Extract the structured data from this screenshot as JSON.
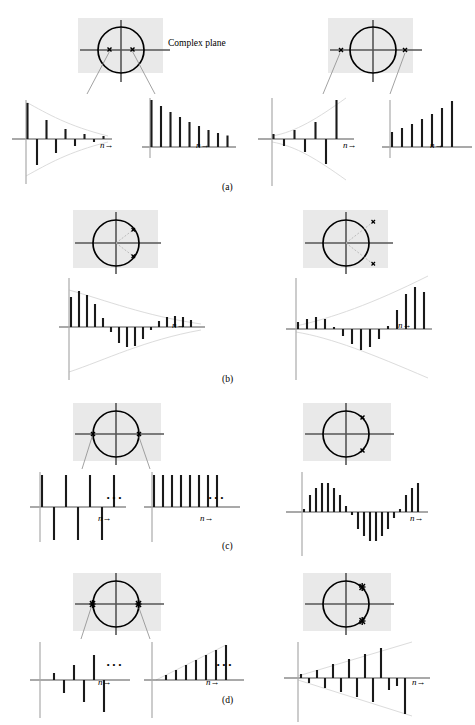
{
  "figure": {
    "running_header": "",
    "complex_plane_label": "Complex plane",
    "axis_label": "n",
    "axis_arrow": "→",
    "ellipsis": "···",
    "panel_letters": [
      "(a)",
      "(b)",
      "(c)",
      "(d)"
    ],
    "colors": {
      "plane_background": "#e9e9e9",
      "stem": "#1a1a1a",
      "axis": "#555555",
      "envelope": "#d9d9d9",
      "circle": "#000000",
      "pole_marker": "#000000",
      "leader": "#8a8a8a"
    }
  },
  "rows": [
    {
      "id": "a",
      "letter": "(a)",
      "left": {
        "id": "a-left",
        "plane": {
          "caption": "Complex plane",
          "circle_radius": 1.0,
          "poles": [
            {
              "re": -0.45,
              "im": 0.0,
              "order": 1,
              "marker": "x"
            },
            {
              "re": 0.45,
              "im": 0.0,
              "order": 1,
              "marker": "x"
            }
          ],
          "leaders": 2
        },
        "plots": [
          {
            "id": "a-left-alt",
            "description": "decaying alternating sequence",
            "envelope": "decaying-exponential",
            "envelope_sign": "both",
            "axis_label": "n",
            "values": [
              1.0,
              -0.72,
              0.52,
              -0.38,
              0.27,
              -0.2,
              0.14,
              -0.1,
              0.07
            ]
          },
          {
            "id": "a-left-pos",
            "description": "decaying positive sequence",
            "envelope": "none",
            "envelope_sign": "none",
            "axis_label": "n",
            "values": [
              1.0,
              0.86,
              0.74,
              0.63,
              0.54,
              0.47,
              0.4,
              0.34,
              0.29
            ]
          }
        ]
      },
      "right": {
        "id": "a-right",
        "plane": {
          "caption": "",
          "circle_radius": 1.0,
          "poles": [
            {
              "re": -1.62,
              "im": 0.0,
              "order": 1,
              "marker": "x"
            },
            {
              "re": 1.62,
              "im": 0.0,
              "order": 1,
              "marker": "x"
            }
          ],
          "leaders": 2
        },
        "plots": [
          {
            "id": "a-right-alt",
            "description": "growing alternating sequence",
            "envelope": "growing-exponential",
            "envelope_sign": "both",
            "axis_label": "n",
            "values": [
              0.14,
              -0.2,
              0.28,
              -0.39,
              0.55,
              -0.76,
              1.0
            ]
          },
          {
            "id": "a-right-pos",
            "description": "growing positive sequence",
            "envelope": "none",
            "envelope_sign": "none",
            "axis_label": "n",
            "values": [
              0.35,
              0.43,
              0.52,
              0.62,
              0.73,
              0.86,
              1.0
            ]
          }
        ]
      }
    },
    {
      "id": "b",
      "letter": "(b)",
      "left": {
        "id": "b-left",
        "plane": {
          "caption": "",
          "circle_radius": 1.0,
          "poles": [
            {
              "re": 0.52,
              "im": 0.4,
              "order": 1,
              "marker": "x"
            },
            {
              "re": 0.52,
              "im": -0.4,
              "order": 1,
              "marker": "x"
            }
          ],
          "radials": 2,
          "leaders": 0
        },
        "plots": [
          {
            "id": "b-left-osc",
            "description": "damped oscillating sequence",
            "envelope": "decaying-exponential",
            "envelope_sign": "both",
            "axis_label": "n",
            "values": [
              0.78,
              0.96,
              0.84,
              0.6,
              0.24,
              -0.14,
              -0.42,
              -0.54,
              -0.5,
              -0.32,
              -0.08,
              0.14,
              0.26,
              0.3,
              0.26,
              0.16
            ]
          }
        ]
      },
      "right": {
        "id": "b-right",
        "plane": {
          "caption": "",
          "circle_radius": 1.0,
          "poles": [
            {
              "re": 0.8,
              "im": 0.62,
              "order": 1,
              "marker": "x"
            },
            {
              "re": 0.8,
              "im": -0.62,
              "order": 1,
              "marker": "x"
            }
          ],
          "radials": 2,
          "leaders": 0
        },
        "plots": [
          {
            "id": "b-right-osc",
            "description": "growing oscillating sequence",
            "envelope": "growing-exponential",
            "envelope_sign": "both",
            "axis_label": "n",
            "values": [
              0.18,
              0.26,
              0.3,
              0.24,
              0.06,
              -0.18,
              -0.38,
              -0.5,
              -0.46,
              -0.26,
              0.08,
              0.46,
              0.8,
              1.0,
              0.92
            ]
          }
        ]
      }
    },
    {
      "id": "c",
      "letter": "(c)",
      "left": {
        "id": "c-left",
        "plane": {
          "caption": "",
          "circle_radius": 1.0,
          "poles": [
            {
              "re": -1.0,
              "im": 0.0,
              "order": 1,
              "marker": "x"
            },
            {
              "re": 1.0,
              "im": 0.0,
              "order": 1,
              "marker": "x"
            }
          ],
          "leaders": 2
        },
        "plots": [
          {
            "id": "c-left-alt",
            "description": "constant amplitude alternating sequence",
            "envelope": "none",
            "envelope_sign": "none",
            "axis_label": "n",
            "ellipsis": "···",
            "values": [
              1,
              -1,
              1,
              -1,
              1,
              -1,
              1
            ]
          },
          {
            "id": "c-left-pos",
            "description": "constant unit step sequence",
            "envelope": "none",
            "envelope_sign": "none",
            "axis_label": "n",
            "ellipsis": "···",
            "values": [
              1,
              1,
              1,
              1,
              1,
              1,
              1,
              1
            ]
          }
        ]
      },
      "right": {
        "id": "c-right",
        "plane": {
          "caption": "",
          "circle_radius": 1.0,
          "poles": [
            {
              "re": 0.64,
              "im": 0.77,
              "order": 1,
              "marker": "x"
            },
            {
              "re": 0.64,
              "im": -0.77,
              "order": 1,
              "marker": "x"
            }
          ],
          "leaders": 0
        },
        "plots": [
          {
            "id": "c-right-sine",
            "description": "constant amplitude sinusoidal sequence",
            "envelope": "none",
            "envelope_sign": "none",
            "axis_label": "n",
            "values": [
              0.1,
              0.55,
              0.8,
              0.97,
              0.97,
              0.8,
              0.55,
              0.18,
              -0.1,
              -0.55,
              -0.8,
              -0.97,
              -0.97,
              -0.8,
              -0.55,
              -0.18,
              0.1,
              0.55,
              0.8,
              0.97
            ]
          }
        ]
      }
    },
    {
      "id": "d",
      "letter": "(d)",
      "left": {
        "id": "d-left",
        "plane": {
          "caption": "",
          "circle_radius": 1.0,
          "poles": [
            {
              "re": -1.0,
              "im": 0.0,
              "order": 2,
              "marker": "xx"
            },
            {
              "re": 1.0,
              "im": 0.0,
              "order": 2,
              "marker": "xx"
            }
          ],
          "leaders": 2
        },
        "plots": [
          {
            "id": "d-left-alt",
            "description": "linearly growing alternating sequence",
            "envelope": "none",
            "envelope_sign": "none",
            "axis_label": "n",
            "ellipsis": "···",
            "values": [
              0.0,
              0.22,
              -0.42,
              0.62,
              -0.82,
              1.0,
              -1.2
            ]
          },
          {
            "id": "d-left-pos",
            "description": "linearly growing positive sequence",
            "envelope": "linear-ramp",
            "envelope_sign": "positive",
            "axis_label": "n",
            "ellipsis": "···",
            "values": [
              0.0,
              0.18,
              0.34,
              0.5,
              0.66,
              0.82,
              0.98,
              1.14
            ]
          }
        ]
      },
      "right": {
        "id": "d-right",
        "plane": {
          "caption": "",
          "circle_radius": 1.0,
          "poles": [
            {
              "re": 0.7,
              "im": 0.71,
              "order": 2,
              "marker": "xx"
            },
            {
              "re": 0.7,
              "im": -0.71,
              "order": 2,
              "marker": "xx"
            }
          ],
          "leaders": 0
        },
        "plots": [
          {
            "id": "d-right-osc",
            "description": "linearly growing oscillating sequence",
            "envelope": "linear-ramp",
            "envelope_sign": "both",
            "axis_label": "n",
            "values": [
              0.08,
              -0.18,
              0.26,
              -0.34,
              0.46,
              -0.52,
              0.62,
              -0.7,
              0.82,
              -0.9,
              1.0,
              -1.1
            ]
          }
        ]
      }
    }
  ]
}
